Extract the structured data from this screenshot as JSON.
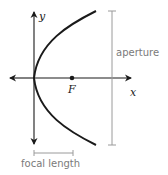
{
  "diagram": {
    "type": "parabola",
    "axes": {
      "x_label": "x",
      "y_label": "y"
    },
    "focus": {
      "label": "F"
    },
    "annotations": {
      "aperture": "aperture",
      "focal_length": "focal length"
    },
    "colors": {
      "curve": "#1a1a1a",
      "axes": "#1a1a1a",
      "bracket": "#9a9a9a",
      "annotation_text": "#7a7a7a"
    }
  }
}
